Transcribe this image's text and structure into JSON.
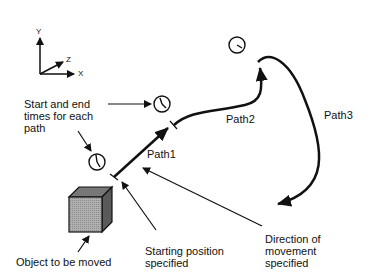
{
  "diagram": {
    "axes": {
      "y": "Y",
      "z": "Z",
      "x": "X"
    },
    "labels": {
      "times": "Start and end\ntimes for each\npath",
      "path1": "Path1",
      "path2": "Path2",
      "path3": "Path3",
      "object": "Object to be moved",
      "start": "Starting position\nspecified",
      "direction": "Direction of\nmovement\nspecified"
    },
    "icons": [
      "clock-icon",
      "clock-icon",
      "clock-icon",
      "cube-icon",
      "axes-icon"
    ],
    "colors": {
      "ink": "#111111",
      "cube_front": "#a8a8a8",
      "cube_top": "#7a7a7a",
      "cube_side": "#5a5a5a",
      "background": "#ffffff"
    }
  }
}
